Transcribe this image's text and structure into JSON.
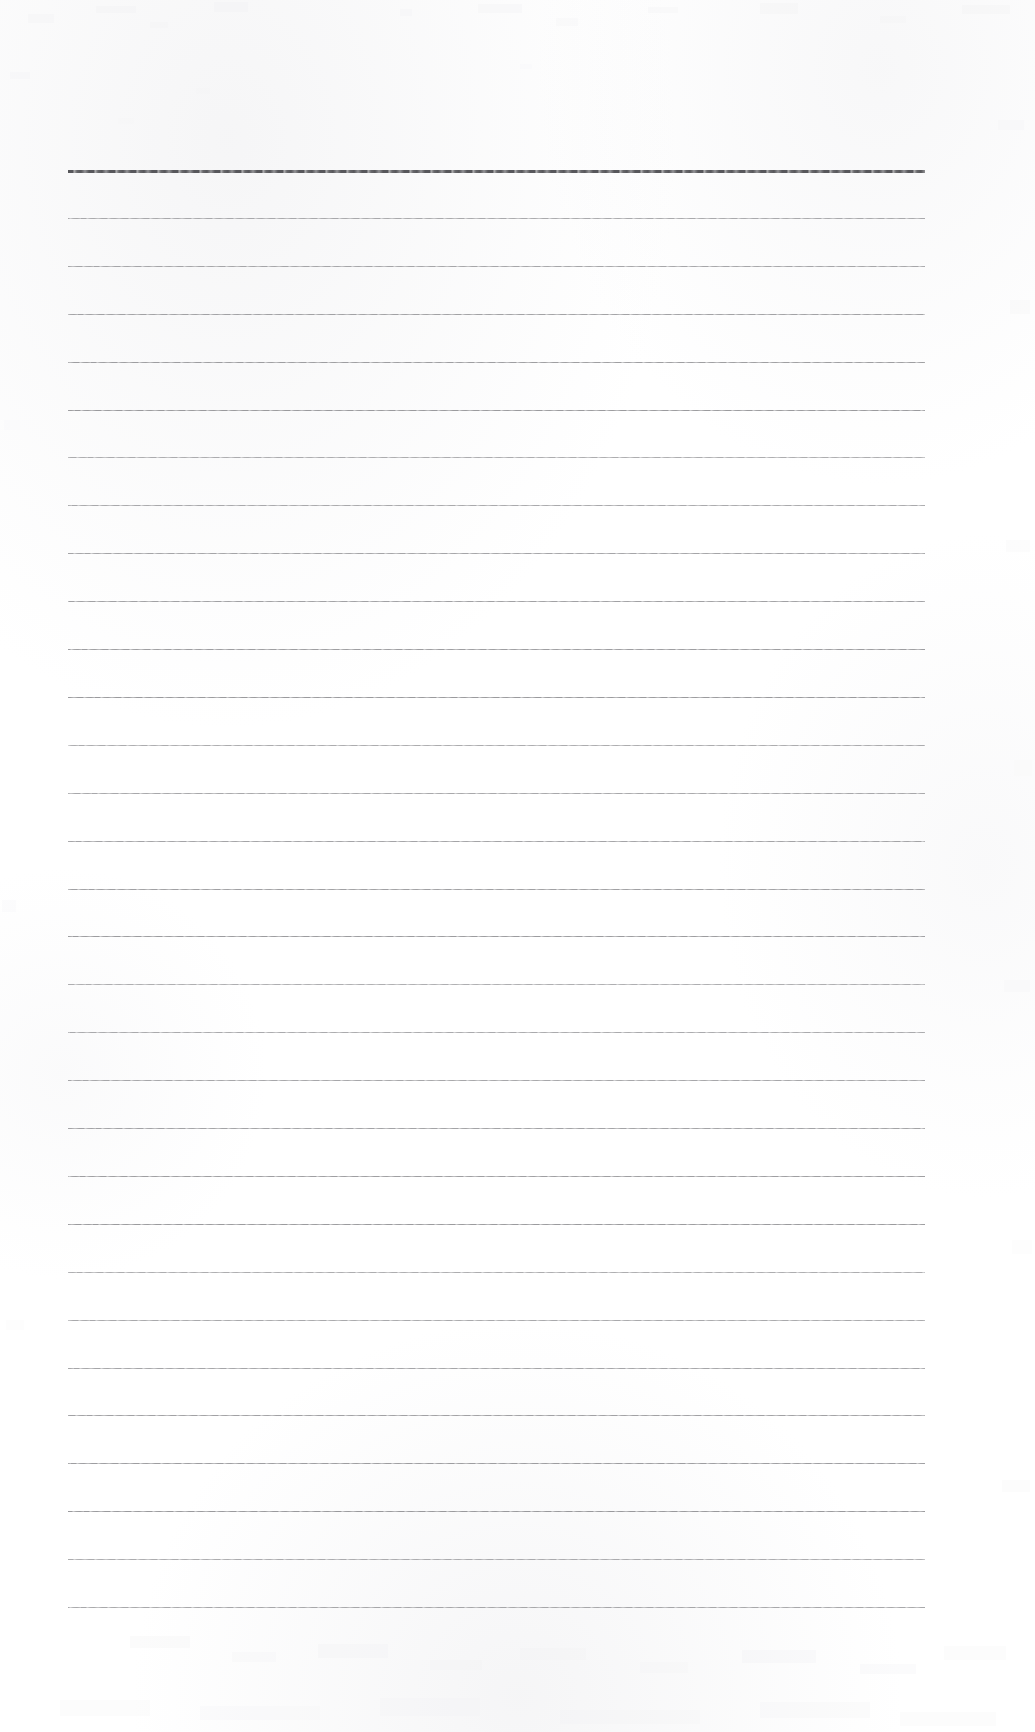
{
  "document": {
    "kind": "scanned-blank-ruled-page",
    "title": "Blank Ruled Notebook Page",
    "page_width": 1035,
    "page_height": 1732,
    "background_color": "#ffffff",
    "content": {
      "text_lines": [],
      "handwriting": "none",
      "printed_text": "none"
    },
    "ruling": {
      "line_color": "#7e7e82",
      "header_line_color": "#4a4a4e",
      "line_start_x": 68,
      "line_end_x": 925,
      "first_line_y": 170,
      "line_spacing": 47.9,
      "line_count": 31,
      "header_line_index": 0,
      "header_line_thickness": 3,
      "body_line_thickness": 1
    },
    "margins": {
      "top": 170,
      "left": 68,
      "right": 110,
      "bottom": 124
    },
    "scan": {
      "has_paper_noise": true,
      "noise_opacity": 0.5
    }
  }
}
